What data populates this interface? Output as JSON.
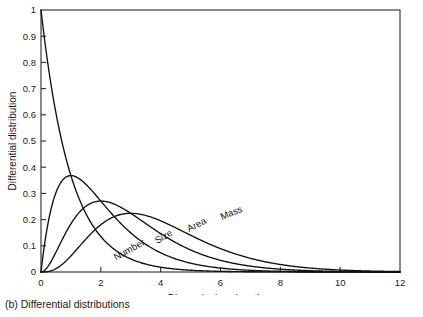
{
  "caption": "(b) Differential distributions",
  "chart_data": {
    "type": "line",
    "title": "",
    "xlabel_text": "Dimensionless length, ",
    "xlabel_symbol": "z",
    "ylabel": "Differential distribution",
    "xlim": [
      0,
      12
    ],
    "ylim": [
      0,
      1
    ],
    "grid": false,
    "legend_position": "inline-curve-labels",
    "xticks": [
      "0",
      "2",
      "4",
      "6",
      "8",
      "10",
      "12"
    ],
    "xtick_values": [
      0,
      2,
      4,
      6,
      8,
      10,
      12
    ],
    "yticks": [
      "0",
      "0.1",
      "0.2",
      "0.3",
      "0.4",
      "0.5",
      "0.6",
      "0.7",
      "0.8",
      "0.9",
      "1"
    ],
    "ytick_values": [
      0,
      0.1,
      0.2,
      0.3,
      0.4,
      0.5,
      0.6,
      0.7,
      0.8,
      0.9,
      1
    ],
    "x": [
      0,
      0.25,
      0.5,
      0.75,
      1,
      1.25,
      1.5,
      1.75,
      2,
      2.25,
      2.5,
      2.75,
      3,
      3.25,
      3.5,
      3.75,
      4,
      4.5,
      5,
      5.5,
      6,
      6.5,
      7,
      7.5,
      8,
      8.5,
      9,
      9.5,
      10,
      10.5,
      11,
      11.5,
      12
    ],
    "series": [
      {
        "name": "Number",
        "label": "Number",
        "formula": "exp(-z)",
        "peak_z": 0,
        "peak_value": 1,
        "label_x": 3.0,
        "label_y": 0.075,
        "label_rotation": 29,
        "values": [
          1,
          0.7788,
          0.6065,
          0.4724,
          0.3679,
          0.2865,
          0.2231,
          0.1738,
          0.1353,
          0.1054,
          0.0821,
          0.0639,
          0.0498,
          0.0388,
          0.0302,
          0.0235,
          0.0183,
          0.0111,
          0.0067,
          0.0041,
          0.0025,
          0.0015,
          0.0009,
          0.0006,
          0.0003,
          0.0002,
          0.0001,
          0.0001,
          0,
          0,
          0,
          0,
          0
        ]
      },
      {
        "name": "Size",
        "label": "Size",
        "formula": "z*exp(-z)",
        "peak_z": 1,
        "peak_value": 0.368,
        "label_x": 4.15,
        "label_y": 0.125,
        "label_rotation": 30,
        "values": [
          0,
          0.1947,
          0.3033,
          0.3543,
          0.3679,
          0.3581,
          0.3347,
          0.3041,
          0.2707,
          0.2371,
          0.2052,
          0.1758,
          0.1494,
          0.1261,
          0.1057,
          0.0882,
          0.0733,
          0.05,
          0.0337,
          0.0225,
          0.0149,
          0.0098,
          0.0064,
          0.0041,
          0.0027,
          0.0017,
          0.0011,
          0.0007,
          0.0005,
          0.0003,
          0.0002,
          0.0001,
          0.0001
        ]
      },
      {
        "name": "Area",
        "label": "Area",
        "formula": "(z^2/2)*exp(-z)",
        "peak_z": 2,
        "peak_value": 0.271,
        "label_x": 5.25,
        "label_y": 0.17,
        "label_rotation": 27,
        "values": [
          0,
          0.0243,
          0.0758,
          0.1329,
          0.1839,
          0.2238,
          0.251,
          0.2661,
          0.2707,
          0.2667,
          0.2565,
          0.2417,
          0.224,
          0.2049,
          0.185,
          0.1654,
          0.1465,
          0.1125,
          0.0842,
          0.0619,
          0.0446,
          0.0318,
          0.0223,
          0.0155,
          0.0107,
          0.0073,
          0.005,
          0.0033,
          0.0023,
          0.0015,
          0.001,
          0.0007,
          0.0004
        ]
      },
      {
        "name": "Mass",
        "label": "Mass",
        "formula": "(z^3/6)*exp(-z)",
        "peak_z": 3,
        "peak_value": 0.224,
        "label_x": 6.4,
        "label_y": 0.215,
        "label_rotation": 22,
        "values": [
          0,
          0.002,
          0.0126,
          0.0332,
          0.0613,
          0.0933,
          0.1255,
          0.1552,
          0.1804,
          0.2,
          0.2138,
          0.2216,
          0.224,
          0.222,
          0.2158,
          0.2068,
          0.1954,
          0.1687,
          0.1404,
          0.1135,
          0.0892,
          0.0689,
          0.0521,
          0.0388,
          0.0286,
          0.0208,
          0.015,
          0.0107,
          0.0076,
          0.0053,
          0.0037,
          0.0026,
          0.0018
        ]
      }
    ]
  }
}
